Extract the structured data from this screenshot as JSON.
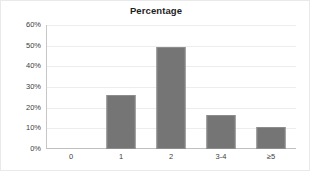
{
  "chart_data": {
    "type": "bar",
    "title": "Percentage",
    "xlabel": "",
    "ylabel": "",
    "categories": [
      "0",
      "1",
      "2",
      "3-4",
      "≥5"
    ],
    "values": [
      0,
      26,
      49.5,
      16.5,
      10.5
    ],
    "value_labels": [
      "0%",
      "26%",
      "49.5%",
      "16.5%",
      "10.5%"
    ],
    "ylim": [
      0,
      60
    ],
    "ytick_labels": [
      "0%",
      "10%",
      "20%",
      "30%",
      "40%",
      "50%",
      "60%"
    ],
    "ytick_values": [
      0,
      10,
      20,
      30,
      40,
      50,
      60
    ],
    "grid": true,
    "legend": false,
    "legend_position": "none",
    "bar_color": "#757575",
    "bar_edge_color": "#8d8d8d",
    "gridline_color": "#ededed",
    "axis_color": "#c0c0c0",
    "background_color": "#ffffff",
    "text_color": "#404040",
    "title_color": "#1d1d1d"
  }
}
